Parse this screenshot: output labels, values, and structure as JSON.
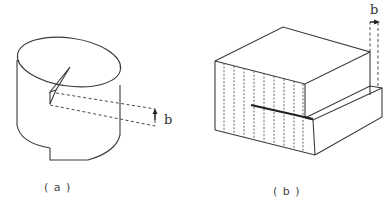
{
  "figure": {
    "panels": [
      {
        "id": "a",
        "caption": "( a )",
        "description": "Cylinder with a crack and dashed extension lines indicating displacement",
        "dimension_label": "b"
      },
      {
        "id": "b",
        "caption": "( b )",
        "description": "Block with step and vertical dashed lines indicating edge dislocation offset",
        "dimension_label": "b"
      }
    ],
    "colors": {
      "line": "#3a3a3a",
      "background": "#ffffff"
    }
  }
}
